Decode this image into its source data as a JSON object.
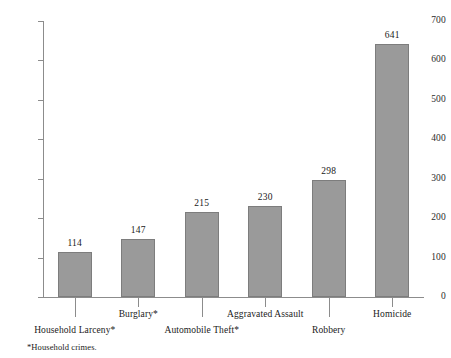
{
  "chart_data": {
    "type": "bar",
    "title": "",
    "subtitle": "",
    "xlabel": "",
    "ylabel": "",
    "categories": [
      "Household Larceny*",
      "Burglary*",
      "Automobile Theft*",
      "Aggravated Assault",
      "Robbery",
      "Homicide"
    ],
    "values": [
      114,
      147,
      215,
      230,
      298,
      641
    ],
    "data_labels": [
      "114",
      "147",
      "215",
      "230",
      "298",
      "641"
    ],
    "ylim": [
      0,
      700
    ],
    "ytick_values": [
      0,
      100,
      200,
      300,
      400,
      500,
      600,
      700
    ],
    "ytick_labels": [
      "0",
      "100",
      "200",
      "300",
      "400",
      "500",
      "600",
      "700"
    ],
    "grid": false,
    "legend": false,
    "legend_position": "none",
    "annotations": [
      "*Household crimes."
    ],
    "bar_color": "#9a9a9a",
    "bar_border_color": "#7d7d7d",
    "axis_color": "#8c8c8c",
    "text_color": "#1a1a1a",
    "background_color": "#ffffff"
  },
  "footnote": {
    "text": "*Household crimes."
  }
}
